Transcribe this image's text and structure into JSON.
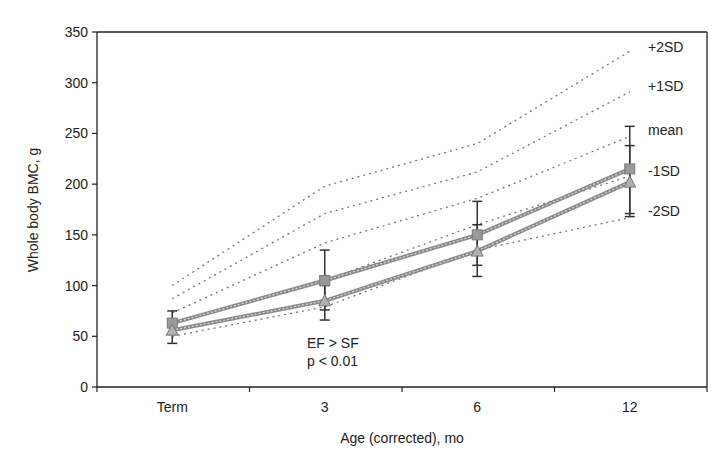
{
  "chart_data": {
    "type": "line",
    "title": "",
    "xlabel": "Age (corrected), mo",
    "ylabel": "Whole body BMC, g",
    "categories": [
      "Term",
      "3",
      "6",
      "12"
    ],
    "ylim": [
      0,
      350
    ],
    "yticks": [
      0,
      50,
      100,
      150,
      200,
      250,
      300,
      350
    ],
    "grid": false,
    "legend": "none (reference lines labeled at right)",
    "reference_lines": [
      {
        "name": "+2SD",
        "values": [
          100,
          198,
          240,
          331
        ]
      },
      {
        "name": "+1SD",
        "values": [
          87,
          171,
          212,
          291
        ]
      },
      {
        "name": "mean",
        "values": [
          73,
          142,
          186,
          247
        ]
      },
      {
        "name": "-1SD",
        "values": [
          62,
          105,
          160,
          208
        ]
      },
      {
        "name": "-2SD",
        "values": [
          50,
          79,
          135,
          167
        ]
      }
    ],
    "series": [
      {
        "name": "EF",
        "marker": "square",
        "values": [
          63,
          105,
          150,
          215
        ],
        "error_low": [
          52,
          76,
          120,
          171
        ],
        "error_high": [
          75,
          135,
          183,
          257
        ]
      },
      {
        "name": "SF",
        "marker": "triangle",
        "values": [
          56,
          85,
          134,
          202
        ],
        "error_low": [
          43,
          66,
          109,
          168
        ],
        "error_high": [
          65,
          100,
          160,
          238
        ]
      }
    ],
    "annotations": [
      "EF > SF",
      "p < 0.01"
    ]
  },
  "colors": {
    "axis": "#222222",
    "series": "#8a8a8a",
    "reference": "#777777"
  }
}
